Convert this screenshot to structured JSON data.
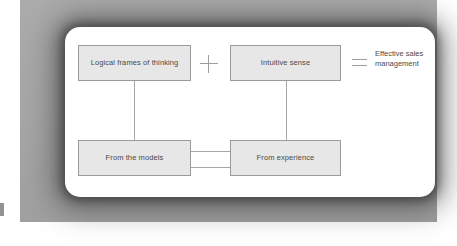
{
  "diagram": {
    "nodes": [
      {
        "id": "logical",
        "label": "Logical frames of thinking"
      },
      {
        "id": "intuitive",
        "label": "Intuitive sense"
      },
      {
        "id": "models",
        "label": "From the models"
      },
      {
        "id": "experience",
        "label": "From experience"
      }
    ],
    "operators": {
      "plus": "+",
      "equals": "="
    },
    "result": {
      "line1": "Effective sales",
      "line2": "management"
    }
  },
  "colors": {
    "page_background": "#ffffff",
    "panel_background": "#a8a8a8",
    "card_background": "#ffffff",
    "node_fill": "#e7e7e7",
    "node_border": "#9a9a9a",
    "text": "#4a4a4a",
    "connector": "#a6a6a6",
    "operator": "#9d9d9d"
  }
}
